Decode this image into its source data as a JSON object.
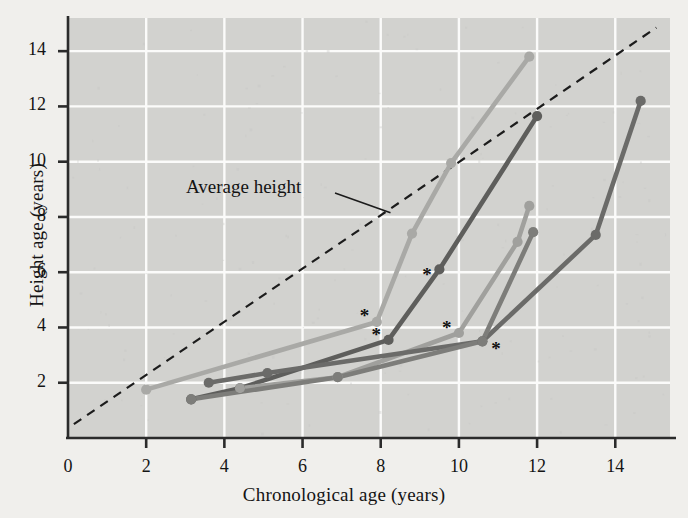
{
  "figure": {
    "background_color": "#f0efec",
    "plot_background_color": "#d2d2cf",
    "grid_color": "#fbfbfa",
    "frame_color": "#2b2b2b"
  },
  "axes": {
    "x": {
      "label": "Chronological age (years)",
      "ticks": [
        0,
        2,
        4,
        6,
        8,
        10,
        12,
        14
      ],
      "tick_labels": [
        "0",
        "2",
        "4",
        "6",
        "8",
        "10",
        "12",
        "14"
      ],
      "range": [
        0,
        15.4
      ]
    },
    "y": {
      "label": "Height age (years)",
      "ticks": [
        2,
        4,
        6,
        8,
        10,
        12,
        14
      ],
      "tick_labels": [
        "2",
        "4",
        "6",
        "8",
        "10",
        "12",
        "14"
      ],
      "range": [
        0,
        15.2
      ]
    }
  },
  "annotations": [
    {
      "name": "average-height-annotation",
      "text": "Average height",
      "target_x": 8.25,
      "target_y": 8.15
    }
  ],
  "chart_data": {
    "type": "line",
    "title": "",
    "xlabel": "Chronological age (years)",
    "ylabel": "Height age (years)",
    "xlim": [
      0,
      15.4
    ],
    "ylim": [
      0,
      15.2
    ],
    "grid": true,
    "legend": "none",
    "reference_line": {
      "name": "Average height",
      "style": "dashed",
      "color": "#1c1c1c",
      "points": [
        [
          0.15,
          0.5
        ],
        [
          15.05,
          14.85
        ]
      ]
    },
    "treatment_markers": {
      "symbol": "*",
      "meaning": "start of growth hormone treatment",
      "points": [
        {
          "x": 7.9,
          "y": 4.2
        },
        {
          "x": 8.2,
          "y": 3.55
        },
        {
          "x": 9.5,
          "y": 6.1
        },
        {
          "x": 10.0,
          "y": 3.8
        },
        {
          "x": 10.6,
          "y": 3.5
        }
      ]
    },
    "series": [
      {
        "name": "patient-1",
        "color": "#a9a9a6",
        "points": [
          [
            2.0,
            1.75
          ],
          [
            7.9,
            4.2
          ],
          [
            8.8,
            7.4
          ],
          [
            9.8,
            9.95
          ],
          [
            11.8,
            13.8
          ]
        ]
      },
      {
        "name": "patient-2",
        "color": "#5e5e5c",
        "points": [
          [
            3.15,
            1.4
          ],
          [
            4.4,
            1.8
          ],
          [
            8.2,
            3.55
          ],
          [
            9.5,
            6.1
          ],
          [
            12.0,
            11.65
          ]
        ]
      },
      {
        "name": "patient-3",
        "color": "#a0a09d",
        "points": [
          [
            4.4,
            1.8
          ],
          [
            6.9,
            2.2
          ],
          [
            10.0,
            3.8
          ],
          [
            11.5,
            7.1
          ],
          [
            11.8,
            8.4
          ]
        ]
      },
      {
        "name": "patient-4",
        "color": "#6b6b69",
        "points": [
          [
            3.6,
            2.0
          ],
          [
            5.1,
            2.35
          ],
          [
            10.6,
            3.5
          ],
          [
            13.5,
            7.35
          ],
          [
            14.65,
            12.2
          ]
        ]
      },
      {
        "name": "patient-5",
        "color": "#7d7d7a",
        "points": [
          [
            3.15,
            1.4
          ],
          [
            6.9,
            2.2
          ],
          [
            10.6,
            3.5
          ],
          [
            11.9,
            7.45
          ]
        ]
      }
    ]
  }
}
